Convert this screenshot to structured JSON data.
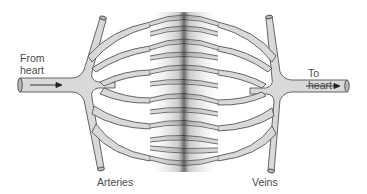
{
  "diagram": {
    "labels": {
      "from_heart": "From\nheart",
      "to_heart": "To\nheart",
      "arteries": "Arteries",
      "veins": "Veins"
    },
    "colors": {
      "vessel_fill": "#d9d9d9",
      "vessel_stroke": "#555555",
      "capillary_dense": "#3a3a3a",
      "background": "#ffffff",
      "text": "#4a4a4a"
    },
    "flow_arrows": [
      {
        "name": "inflow-arrow",
        "direction": "right",
        "side": "left"
      },
      {
        "name": "outflow-arrow",
        "direction": "right",
        "side": "right"
      }
    ]
  }
}
